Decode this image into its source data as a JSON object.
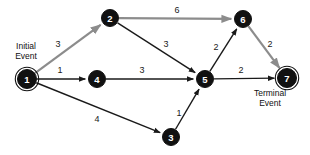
{
  "diagram": {
    "width": 310,
    "height": 155,
    "background_color": "#ffffff",
    "normal_edge_color": "#1a1a1a",
    "critical_edge_color": "#8c8c8c",
    "node_fill_color": "#111111",
    "node_text_color": "#ffffff"
  },
  "annotations": [
    {
      "id": "initial-event",
      "line1": "Initial",
      "line2": "Event",
      "x": 26,
      "y": 49
    },
    {
      "id": "terminal-event",
      "line1": "Terminal",
      "line2": "Event",
      "x": 270,
      "y": 96
    }
  ],
  "nodes": [
    {
      "id": "1",
      "label": "1",
      "x": 27,
      "y": 79,
      "r": 9.5,
      "double_ring": true
    },
    {
      "id": "2",
      "label": "2",
      "x": 110,
      "y": 18,
      "r": 8.5,
      "double_ring": false
    },
    {
      "id": "3",
      "label": "3",
      "x": 171,
      "y": 137,
      "r": 8.5,
      "double_ring": false
    },
    {
      "id": "4",
      "label": "4",
      "x": 97,
      "y": 79,
      "r": 8.5,
      "double_ring": false
    },
    {
      "id": "5",
      "label": "5",
      "x": 205,
      "y": 79,
      "r": 8.5,
      "double_ring": false
    },
    {
      "id": "6",
      "label": "6",
      "x": 243,
      "y": 19,
      "r": 8.5,
      "double_ring": false
    },
    {
      "id": "7",
      "label": "7",
      "x": 287,
      "y": 78,
      "r": 9.5,
      "double_ring": true
    }
  ],
  "edges": [
    {
      "id": "e1-2",
      "from": "1",
      "to": "2",
      "weight": "3",
      "critical": true,
      "label_x": 58,
      "label_y": 45
    },
    {
      "id": "e1-4",
      "from": "1",
      "to": "4",
      "weight": "1",
      "critical": false,
      "label_x": 60,
      "label_y": 71
    },
    {
      "id": "e1-3",
      "from": "1",
      "to": "3",
      "weight": "4",
      "critical": false,
      "label_x": 97,
      "label_y": 120
    },
    {
      "id": "e2-6",
      "from": "2",
      "to": "6",
      "weight": "6",
      "critical": true,
      "label_x": 177,
      "label_y": 11
    },
    {
      "id": "e2-5",
      "from": "2",
      "to": "5",
      "weight": "3",
      "critical": false,
      "label_x": 166,
      "label_y": 45
    },
    {
      "id": "e4-5",
      "from": "4",
      "to": "5",
      "weight": "3",
      "critical": false,
      "label_x": 142,
      "label_y": 71
    },
    {
      "id": "e3-5",
      "from": "3",
      "to": "5",
      "weight": "1",
      "critical": false,
      "label_x": 179,
      "label_y": 114
    },
    {
      "id": "e5-6",
      "from": "5",
      "to": "6",
      "weight": "2",
      "critical": false,
      "label_x": 216,
      "label_y": 48
    },
    {
      "id": "e5-7",
      "from": "5",
      "to": "7",
      "weight": "2",
      "critical": false,
      "label_x": 241,
      "label_y": 71
    },
    {
      "id": "e6-7",
      "from": "6",
      "to": "7",
      "weight": "2",
      "critical": true,
      "label_x": 270,
      "label_y": 45
    }
  ]
}
